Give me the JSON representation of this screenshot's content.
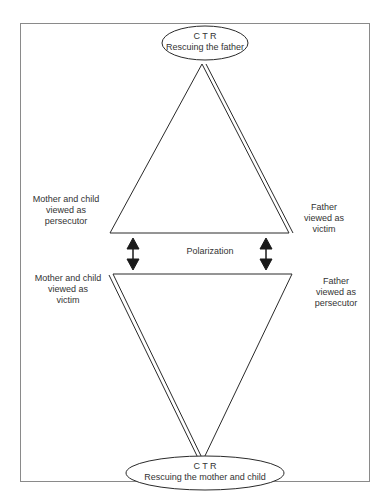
{
  "figure": {
    "top_node": {
      "line1": "C T R",
      "line2": "Rescuing the father"
    },
    "bottom_node": {
      "line1": "C T R",
      "line2": "Rescuing the mother and child"
    },
    "middle_label": "Polarization",
    "upper_left": {
      "line1": "Mother and  child",
      "line2": "viewed as",
      "line3": "persecutor"
    },
    "upper_right": {
      "line1": "Father",
      "line2": "viewed as",
      "line3": "victim"
    },
    "lower_left": {
      "line1": "Mother and child",
      "line2": "viewed as",
      "line3": "victim"
    },
    "lower_right": {
      "line1": "Father",
      "line2": "viewed as",
      "line3": "persecutor"
    }
  },
  "colors": {
    "line": "#2a2a2a",
    "frame": "#8a8a8a",
    "background": "#ffffff"
  }
}
